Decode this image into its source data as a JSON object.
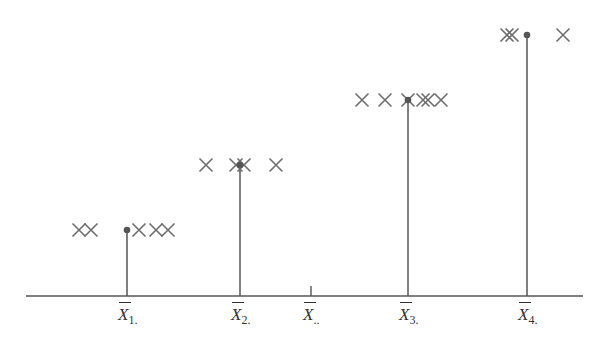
{
  "diagram": {
    "type": "dot-stem diagram of group observations and group means",
    "axis": {
      "x1": 26,
      "x2": 583,
      "y": 296,
      "color": "#555555"
    },
    "colors": {
      "cross": "#6e6e6e",
      "stem": "#555555",
      "dot": "#555555"
    },
    "groups": [
      {
        "label_main": "X",
        "label_sub": "1.",
        "mean_x": 127,
        "level_y": 230,
        "crosses": [
          79,
          91,
          139,
          156,
          168
        ]
      },
      {
        "label_main": "X",
        "label_sub": "2.",
        "mean_x": 240,
        "level_y": 165,
        "crosses": [
          206,
          236,
          244,
          276
        ]
      },
      {
        "label_main": "X",
        "label_sub": "3.",
        "mean_x": 408,
        "level_y": 100,
        "crosses": [
          362,
          385,
          408,
          423,
          428,
          441
        ]
      },
      {
        "label_main": "X",
        "label_sub": "4.",
        "mean_x": 527,
        "level_y": 35,
        "crosses": [
          507,
          512,
          563
        ]
      }
    ],
    "grand_mean": {
      "label_main": "X",
      "label_sub": "..",
      "x": 311,
      "tick_height": 10
    }
  }
}
